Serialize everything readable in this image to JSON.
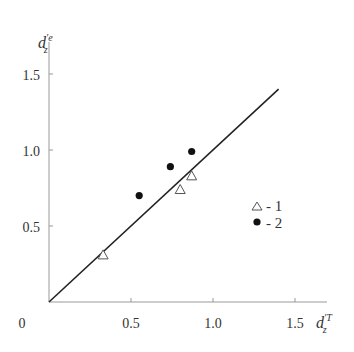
{
  "chart_data": {
    "type": "scatter",
    "title": "",
    "xlabel": "d'_z^T",
    "ylabel": "d'_z^e",
    "xlim": [
      0,
      1.5
    ],
    "ylim": [
      0,
      1.5
    ],
    "x_ticks": [
      "0.5",
      "1.0",
      "1.5"
    ],
    "y_ticks": [
      "0.5",
      "1.0",
      "1.5"
    ],
    "origin_label": "0",
    "grid": false,
    "reference_line": {
      "from": [
        0,
        0
      ],
      "to": [
        1.4,
        1.4
      ],
      "label": "y = x"
    },
    "series": [
      {
        "name": "1",
        "marker": "open-triangle",
        "points": [
          [
            0.33,
            0.31
          ],
          [
            0.8,
            0.74
          ],
          [
            0.87,
            0.83
          ]
        ]
      },
      {
        "name": "2",
        "marker": "filled-circle",
        "points": [
          [
            0.55,
            0.7
          ],
          [
            0.74,
            0.89
          ],
          [
            0.87,
            0.99
          ]
        ]
      }
    ],
    "legend": {
      "position": "right",
      "entries": [
        "△ - 1",
        "● - 2"
      ]
    }
  }
}
